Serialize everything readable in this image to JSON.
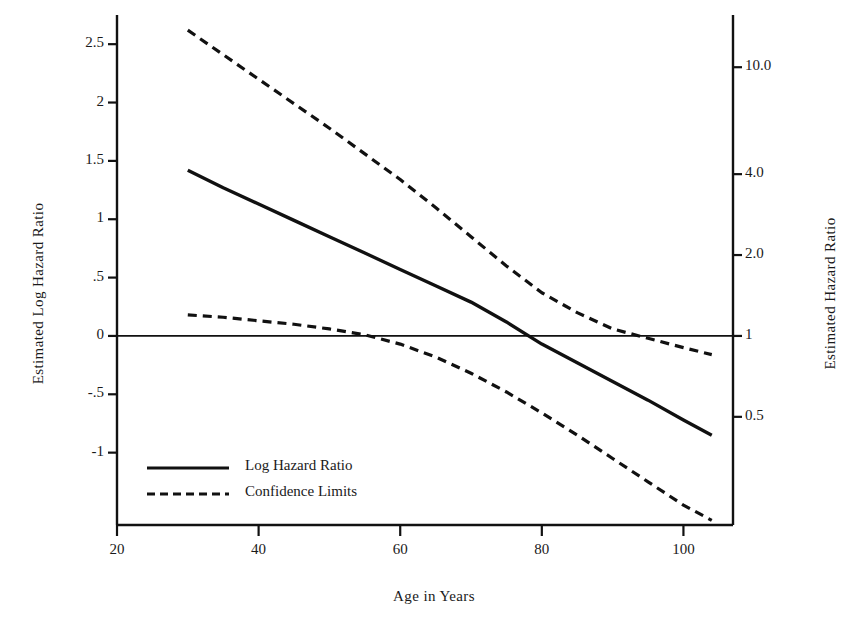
{
  "chart_data": {
    "type": "line",
    "title": "",
    "xlabel": "Age in Years",
    "ylabel": "Estimated Log Hazard Ratio",
    "ylabel_right": "Estimated Hazard Ratio",
    "xlim": [
      20,
      107
    ],
    "ylim": [
      -1.62,
      2.75
    ],
    "grid": false,
    "legend_position": "lower-left-inside",
    "x_ticks": [
      20,
      40,
      60,
      80,
      100
    ],
    "x_tick_labels": [
      "20",
      "40",
      "60",
      "80",
      "100"
    ],
    "y_ticks_left": [
      2.5,
      2,
      1.5,
      1,
      0.5,
      0,
      -0.5,
      -1
    ],
    "y_tick_labels_left": [
      "2.5",
      "2",
      "1.5",
      "1",
      ".5",
      "0",
      "-.5",
      "-1"
    ],
    "y_ticks_right_log": [
      2.302585,
      1.386294,
      0.693147,
      0,
      -0.693147
    ],
    "y_tick_labels_right": [
      "10.0",
      "4.0",
      "2.0",
      "1",
      "0.5"
    ],
    "reference_line_y": 0,
    "series": [
      {
        "name": "Log Hazard Ratio",
        "style": "solid",
        "color": "#111111",
        "x": [
          30,
          35,
          40,
          45,
          50,
          55,
          60,
          65,
          70,
          75,
          80,
          85,
          90,
          95,
          100,
          104
        ],
        "values": [
          1.42,
          1.27,
          1.13,
          0.99,
          0.85,
          0.71,
          0.57,
          0.43,
          0.29,
          0.12,
          -0.07,
          -0.23,
          -0.39,
          -0.55,
          -0.72,
          -0.85
        ]
      },
      {
        "name": "Upper Confidence Limit",
        "style": "dashed",
        "color": "#111111",
        "x": [
          30,
          35,
          40,
          45,
          50,
          55,
          60,
          65,
          70,
          75,
          80,
          85,
          90,
          95,
          100,
          104
        ],
        "values": [
          2.62,
          2.41,
          2.2,
          1.99,
          1.78,
          1.56,
          1.34,
          1.1,
          0.85,
          0.6,
          0.37,
          0.2,
          0.06,
          -0.02,
          -0.1,
          -0.16
        ]
      },
      {
        "name": "Lower Confidence Limit",
        "style": "dashed",
        "color": "#111111",
        "x": [
          30,
          35,
          40,
          45,
          50,
          55,
          60,
          65,
          70,
          75,
          80,
          85,
          90,
          95,
          100,
          104
        ],
        "values": [
          0.18,
          0.16,
          0.13,
          0.1,
          0.06,
          0.01,
          -0.07,
          -0.18,
          -0.32,
          -0.48,
          -0.66,
          -0.85,
          -1.05,
          -1.25,
          -1.45,
          -1.58
        ]
      }
    ],
    "legend": [
      {
        "label": "Log Hazard Ratio",
        "style": "solid"
      },
      {
        "label": "Confidence Limits",
        "style": "dashed"
      }
    ]
  }
}
